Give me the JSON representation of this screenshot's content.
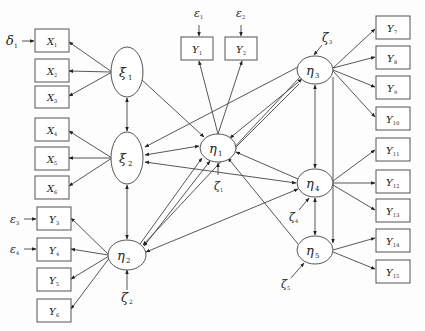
{
  "diagram": {
    "type": "structural-equation-model",
    "exogenous_latents": [
      {
        "id": "xi1",
        "symbol": "ξ",
        "sub": "1"
      },
      {
        "id": "xi2",
        "symbol": "ξ",
        "sub": "2"
      }
    ],
    "endogenous_latents": [
      {
        "id": "eta1",
        "symbol": "η",
        "sub": "1"
      },
      {
        "id": "eta2",
        "symbol": "η",
        "sub": "2"
      },
      {
        "id": "eta3",
        "symbol": "η",
        "sub": "3"
      },
      {
        "id": "eta4",
        "symbol": "η",
        "sub": "4"
      },
      {
        "id": "eta5",
        "symbol": "η",
        "sub": "5"
      }
    ],
    "x_indicators": [
      {
        "id": "X1",
        "symbol": "X",
        "sub": "1",
        "latent": "xi1"
      },
      {
        "id": "X2",
        "symbol": "X",
        "sub": "2",
        "latent": "xi1"
      },
      {
        "id": "X3",
        "symbol": "X",
        "sub": "3",
        "latent": "xi1"
      },
      {
        "id": "X4",
        "symbol": "X",
        "sub": "4",
        "latent": "xi2"
      },
      {
        "id": "X5",
        "symbol": "X",
        "sub": "5",
        "latent": "xi2"
      },
      {
        "id": "X6",
        "symbol": "X",
        "sub": "6",
        "latent": "xi2"
      }
    ],
    "y_indicators": [
      {
        "id": "Y1",
        "symbol": "Y",
        "sub": "1",
        "latent": "eta1"
      },
      {
        "id": "Y2",
        "symbol": "Y",
        "sub": "2",
        "latent": "eta1"
      },
      {
        "id": "Y3",
        "symbol": "Y",
        "sub": "3",
        "latent": "eta2"
      },
      {
        "id": "Y4",
        "symbol": "Y",
        "sub": "4",
        "latent": "eta2"
      },
      {
        "id": "Y5",
        "symbol": "Y",
        "sub": "5",
        "latent": "eta2"
      },
      {
        "id": "Y6",
        "symbol": "Y",
        "sub": "6",
        "latent": "eta2"
      },
      {
        "id": "Y7",
        "symbol": "Y",
        "sub": "7",
        "latent": "eta3"
      },
      {
        "id": "Y8",
        "symbol": "Y",
        "sub": "8",
        "latent": "eta3"
      },
      {
        "id": "Y9",
        "symbol": "Y",
        "sub": "9",
        "latent": "eta3"
      },
      {
        "id": "Y10",
        "symbol": "Y",
        "sub": "10",
        "latent": "eta3"
      },
      {
        "id": "Y11",
        "symbol": "Y",
        "sub": "11",
        "latent": "eta4"
      },
      {
        "id": "Y12",
        "symbol": "Y",
        "sub": "12",
        "latent": "eta4"
      },
      {
        "id": "Y13",
        "symbol": "Y",
        "sub": "13",
        "latent": "eta4"
      },
      {
        "id": "Y14",
        "symbol": "Y",
        "sub": "14",
        "latent": "eta5"
      },
      {
        "id": "Y15",
        "symbol": "Y",
        "sub": "15",
        "latent": "eta5"
      }
    ],
    "error_terms": [
      {
        "id": "delta1",
        "symbol": "δ",
        "sub": "1",
        "target": "X1"
      },
      {
        "id": "eps1",
        "symbol": "ε",
        "sub": "1",
        "target": "Y1"
      },
      {
        "id": "eps2",
        "symbol": "ε",
        "sub": "2",
        "target": "Y2"
      },
      {
        "id": "eps3",
        "symbol": "ε",
        "sub": "3",
        "target": "Y3"
      },
      {
        "id": "eps4",
        "symbol": "ε",
        "sub": "4",
        "target": "Y4"
      }
    ],
    "disturbances": [
      {
        "id": "zeta1",
        "symbol": "ζ",
        "sub": "1",
        "target": "eta1"
      },
      {
        "id": "zeta2",
        "symbol": "ζ",
        "sub": "2",
        "target": "eta2"
      },
      {
        "id": "zeta3",
        "symbol": "ζ",
        "sub": "3",
        "target": "eta3"
      },
      {
        "id": "zeta4",
        "symbol": "ζ",
        "sub": "4",
        "target": "eta4"
      },
      {
        "id": "zeta5",
        "symbol": "ζ",
        "sub": "5",
        "target": "eta5"
      }
    ],
    "paths": [
      {
        "from": "xi1",
        "to": "eta1",
        "type": "directed"
      },
      {
        "from": "xi1",
        "to": "xi2",
        "type": "bidirectional"
      },
      {
        "from": "xi2",
        "to": "eta2",
        "type": "bidirectional"
      },
      {
        "from": "xi2",
        "to": "eta1",
        "type": "bidirectional"
      },
      {
        "from": "xi2",
        "to": "eta4",
        "type": "bidirectional"
      },
      {
        "from": "eta3",
        "to": "xi2",
        "type": "directed"
      },
      {
        "from": "eta2",
        "to": "eta1",
        "type": "bidirectional"
      },
      {
        "from": "eta2",
        "to": "eta4",
        "type": "bidirectional"
      },
      {
        "from": "eta1",
        "to": "eta3",
        "type": "bidirectional"
      },
      {
        "from": "eta3",
        "to": "eta1",
        "type": "directed"
      },
      {
        "from": "eta4",
        "to": "eta1",
        "type": "directed"
      },
      {
        "from": "eta5",
        "to": "eta1",
        "type": "directed"
      },
      {
        "from": "eta3",
        "to": "eta2",
        "type": "directed"
      },
      {
        "from": "eta3",
        "to": "eta4",
        "type": "bidirectional"
      },
      {
        "from": "eta4",
        "to": "eta5",
        "type": "bidirectional"
      },
      {
        "from": "eta3",
        "to": "eta5",
        "type": "directed"
      }
    ]
  }
}
